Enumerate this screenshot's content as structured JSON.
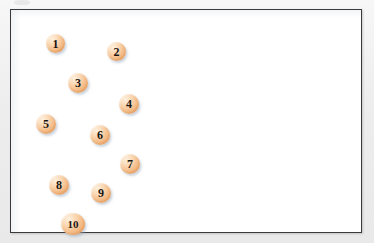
{
  "document": {
    "title": "Numbered circle scatter figure",
    "background_color": "#f0f0f0",
    "canvas_color": "#ffffff"
  },
  "frame": {
    "name": "figure-border",
    "border_color": "#3a3a3a",
    "x": 10,
    "y": 9,
    "width": 352,
    "height": 224
  },
  "style": {
    "node_fill_light": "#fdf0df",
    "node_fill_mid": "#f6c392",
    "node_fill_dark": "#e89a5c",
    "node_label_color": "#1a1410",
    "shadow_color": "#96a5b9"
  },
  "chart_data": {
    "type": "scatter",
    "title": "",
    "xlabel": "",
    "ylabel": "",
    "grid": false,
    "legend": null,
    "xlim": [
      0,
      352
    ],
    "ylim": [
      0,
      224
    ],
    "point_shape": "sphere",
    "point_count": 10,
    "labels": [
      "1",
      "2",
      "3",
      "4",
      "5",
      "6",
      "7",
      "8",
      "9",
      "10"
    ],
    "x": [
      35,
      96,
      57,
      108,
      25,
      79,
      109,
      38,
      80,
      50
    ],
    "y": [
      24,
      32,
      63,
      84,
      104,
      115,
      144,
      165,
      173,
      203
    ],
    "points": [
      {
        "label": "1",
        "x": 35,
        "y": 24,
        "d": 19
      },
      {
        "label": "2",
        "x": 96,
        "y": 32,
        "d": 19
      },
      {
        "label": "3",
        "x": 57,
        "y": 63,
        "d": 20
      },
      {
        "label": "4",
        "x": 108,
        "y": 84,
        "d": 20
      },
      {
        "label": "5",
        "x": 25,
        "y": 104,
        "d": 20
      },
      {
        "label": "6",
        "x": 79,
        "y": 115,
        "d": 20
      },
      {
        "label": "7",
        "x": 109,
        "y": 144,
        "d": 20
      },
      {
        "label": "8",
        "x": 38,
        "y": 165,
        "d": 20
      },
      {
        "label": "9",
        "x": 80,
        "y": 173,
        "d": 20
      },
      {
        "label": "10",
        "x": 50,
        "y": 203,
        "d": 22
      }
    ]
  }
}
